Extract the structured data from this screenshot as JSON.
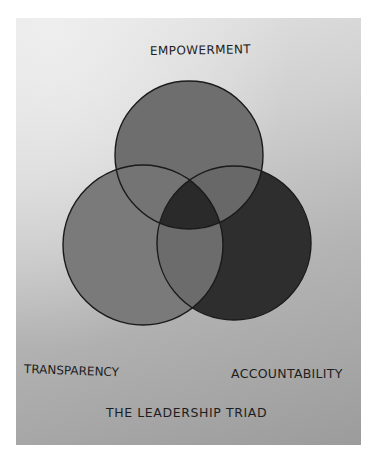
{
  "diagram": {
    "type": "venn",
    "title": "THE LEADERSHIP TRIAD",
    "sets": [
      {
        "id": "top",
        "label": "EMPOWERMENT",
        "cx": 189,
        "cy": 155,
        "r": 74,
        "fill": "#6e6e6e"
      },
      {
        "id": "left",
        "label": "TRANSPARENCY",
        "cx": 143,
        "cy": 245,
        "r": 80,
        "fill": "#7a7a7a"
      },
      {
        "id": "right",
        "label": "ACCOUNTABILITY",
        "cx": 234,
        "cy": 243,
        "r": 77,
        "fill": "#2e2e2e"
      }
    ],
    "regions": {
      "top_left": "#747474",
      "top_right": "#686868",
      "left_right": "#6c6c6c",
      "center": "#2a2a2a"
    },
    "outline_color": "#1a1a1a",
    "paper_color": "#c8c8c8"
  },
  "labels": {
    "top": "EMPOWERMENT",
    "left": "TRANSPARENCY",
    "right": "ACCOUNTABILITY",
    "title": "THE LEADERSHIP TRIAD"
  }
}
